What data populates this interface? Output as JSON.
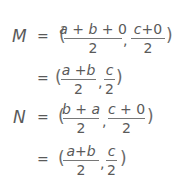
{
  "equations": [
    {
      "lhs": "M",
      "eq": "=",
      "open": "(",
      "frac1": {
        "num_parts": [
          "a",
          " + ",
          "b",
          " + ",
          "0"
        ],
        "den": "2"
      },
      "comma": ",",
      "frac2": {
        "num_parts": [
          "c",
          "+",
          "0"
        ],
        "den": "2"
      },
      "close": ")"
    },
    {
      "lhs": "",
      "eq": "=",
      "open": "(",
      "frac1": {
        "num_parts": [
          "a",
          " +",
          "b"
        ],
        "den": "2"
      },
      "comma": ",",
      "frac2": {
        "num_parts": [
          "c"
        ],
        "den": "2"
      },
      "close": ")"
    },
    {
      "lhs": "N",
      "eq": "=",
      "open": "(",
      "frac1": {
        "num_parts": [
          "b",
          " + ",
          "a"
        ],
        "den": "2"
      },
      "comma": ",",
      "frac2": {
        "num_parts": [
          "c",
          " + ",
          "0"
        ],
        "den": "2"
      },
      "close": ")"
    },
    {
      "lhs": "",
      "eq": "=",
      "open": "(",
      "frac1": {
        "num_parts": [
          "a",
          "+",
          "b"
        ],
        "den": "2"
      },
      "comma": ",",
      "frac2": {
        "num_parts": [
          "c"
        ],
        "den": "2"
      },
      "close": ")"
    }
  ]
}
